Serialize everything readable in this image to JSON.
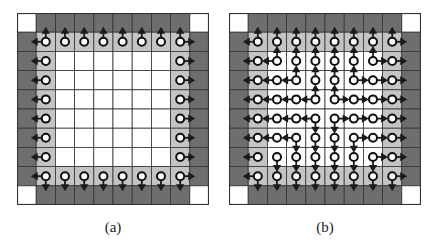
{
  "colors": {
    "outer": "#6e6e6e",
    "boundary": "#c4c4c4",
    "inner": "#ffffff",
    "corner": "#ffffff",
    "grid_line": "#333333",
    "arrow": "#1a1a1a",
    "node_fill": "#ffffff",
    "node_stroke": "#111111"
  },
  "grid_size": 10,
  "panels": [
    {
      "id": "a",
      "caption": "(a)",
      "light_cells": "boundary-ring",
      "nodes": "boundary-ring",
      "arrows": [
        {
          "r": 1,
          "c": 1,
          "d": "L"
        },
        {
          "r": 1,
          "c": 1,
          "d": "U"
        },
        {
          "r": 1,
          "c": 2,
          "d": "U"
        },
        {
          "r": 1,
          "c": 3,
          "d": "U"
        },
        {
          "r": 1,
          "c": 4,
          "d": "U"
        },
        {
          "r": 1,
          "c": 5,
          "d": "U"
        },
        {
          "r": 1,
          "c": 6,
          "d": "U"
        },
        {
          "r": 1,
          "c": 7,
          "d": "U"
        },
        {
          "r": 1,
          "c": 8,
          "d": "U"
        },
        {
          "r": 1,
          "c": 8,
          "d": "R"
        },
        {
          "r": 2,
          "c": 1,
          "d": "L"
        },
        {
          "r": 3,
          "c": 1,
          "d": "L"
        },
        {
          "r": 4,
          "c": 1,
          "d": "L"
        },
        {
          "r": 5,
          "c": 1,
          "d": "L"
        },
        {
          "r": 6,
          "c": 1,
          "d": "L"
        },
        {
          "r": 7,
          "c": 1,
          "d": "L"
        },
        {
          "r": 2,
          "c": 8,
          "d": "R"
        },
        {
          "r": 3,
          "c": 8,
          "d": "R"
        },
        {
          "r": 4,
          "c": 8,
          "d": "R"
        },
        {
          "r": 5,
          "c": 8,
          "d": "R"
        },
        {
          "r": 6,
          "c": 8,
          "d": "R"
        },
        {
          "r": 7,
          "c": 8,
          "d": "R"
        },
        {
          "r": 8,
          "c": 1,
          "d": "L"
        },
        {
          "r": 8,
          "c": 1,
          "d": "D"
        },
        {
          "r": 8,
          "c": 2,
          "d": "D"
        },
        {
          "r": 8,
          "c": 3,
          "d": "D"
        },
        {
          "r": 8,
          "c": 4,
          "d": "D"
        },
        {
          "r": 8,
          "c": 5,
          "d": "D"
        },
        {
          "r": 8,
          "c": 6,
          "d": "D"
        },
        {
          "r": 8,
          "c": 7,
          "d": "D"
        },
        {
          "r": 8,
          "c": 8,
          "d": "D"
        },
        {
          "r": 8,
          "c": 8,
          "d": "R"
        }
      ]
    },
    {
      "id": "b",
      "caption": "(b)",
      "light_cells": "boundary-ring",
      "nodes": "all-inner",
      "arrows": [
        {
          "r": 1,
          "c": 1,
          "d": "L"
        },
        {
          "r": 1,
          "c": 1,
          "d": "U"
        },
        {
          "r": 1,
          "c": 2,
          "d": "U"
        },
        {
          "r": 1,
          "c": 3,
          "d": "U"
        },
        {
          "r": 1,
          "c": 4,
          "d": "U"
        },
        {
          "r": 1,
          "c": 5,
          "d": "U"
        },
        {
          "r": 1,
          "c": 6,
          "d": "U"
        },
        {
          "r": 1,
          "c": 7,
          "d": "U"
        },
        {
          "r": 1,
          "c": 8,
          "d": "U"
        },
        {
          "r": 1,
          "c": 8,
          "d": "R"
        },
        {
          "r": 2,
          "c": 1,
          "d": "L"
        },
        {
          "r": 2,
          "c": 2,
          "d": "L"
        },
        {
          "r": 2,
          "c": 2,
          "d": "U"
        },
        {
          "r": 2,
          "c": 3,
          "d": "U"
        },
        {
          "r": 2,
          "c": 4,
          "d": "U"
        },
        {
          "r": 2,
          "c": 5,
          "d": "U"
        },
        {
          "r": 2,
          "c": 6,
          "d": "U"
        },
        {
          "r": 2,
          "c": 7,
          "d": "U"
        },
        {
          "r": 2,
          "c": 7,
          "d": "R"
        },
        {
          "r": 2,
          "c": 8,
          "d": "R"
        },
        {
          "r": 3,
          "c": 1,
          "d": "L"
        },
        {
          "r": 3,
          "c": 2,
          "d": "L"
        },
        {
          "r": 3,
          "c": 3,
          "d": "L"
        },
        {
          "r": 3,
          "c": 3,
          "d": "U"
        },
        {
          "r": 3,
          "c": 4,
          "d": "U"
        },
        {
          "r": 3,
          "c": 5,
          "d": "U"
        },
        {
          "r": 3,
          "c": 6,
          "d": "U"
        },
        {
          "r": 3,
          "c": 6,
          "d": "R"
        },
        {
          "r": 3,
          "c": 7,
          "d": "R"
        },
        {
          "r": 3,
          "c": 8,
          "d": "R"
        },
        {
          "r": 4,
          "c": 1,
          "d": "L"
        },
        {
          "r": 4,
          "c": 2,
          "d": "L"
        },
        {
          "r": 4,
          "c": 3,
          "d": "L"
        },
        {
          "r": 4,
          "c": 4,
          "d": "L"
        },
        {
          "r": 4,
          "c": 4,
          "d": "U"
        },
        {
          "r": 4,
          "c": 5,
          "d": "U"
        },
        {
          "r": 4,
          "c": 5,
          "d": "R"
        },
        {
          "r": 4,
          "c": 6,
          "d": "R"
        },
        {
          "r": 4,
          "c": 7,
          "d": "R"
        },
        {
          "r": 4,
          "c": 8,
          "d": "R"
        },
        {
          "r": 5,
          "c": 1,
          "d": "L"
        },
        {
          "r": 5,
          "c": 2,
          "d": "L"
        },
        {
          "r": 5,
          "c": 3,
          "d": "L"
        },
        {
          "r": 5,
          "c": 4,
          "d": "L"
        },
        {
          "r": 5,
          "c": 4,
          "d": "D"
        },
        {
          "r": 5,
          "c": 5,
          "d": "D"
        },
        {
          "r": 5,
          "c": 5,
          "d": "R"
        },
        {
          "r": 5,
          "c": 6,
          "d": "R"
        },
        {
          "r": 5,
          "c": 7,
          "d": "R"
        },
        {
          "r": 5,
          "c": 8,
          "d": "R"
        },
        {
          "r": 6,
          "c": 1,
          "d": "L"
        },
        {
          "r": 6,
          "c": 2,
          "d": "L"
        },
        {
          "r": 6,
          "c": 3,
          "d": "L"
        },
        {
          "r": 6,
          "c": 3,
          "d": "D"
        },
        {
          "r": 6,
          "c": 4,
          "d": "D"
        },
        {
          "r": 6,
          "c": 5,
          "d": "D"
        },
        {
          "r": 6,
          "c": 6,
          "d": "D"
        },
        {
          "r": 6,
          "c": 6,
          "d": "R"
        },
        {
          "r": 6,
          "c": 7,
          "d": "R"
        },
        {
          "r": 6,
          "c": 8,
          "d": "R"
        },
        {
          "r": 7,
          "c": 1,
          "d": "L"
        },
        {
          "r": 7,
          "c": 2,
          "d": "D"
        },
        {
          "r": 7,
          "c": 3,
          "d": "D"
        },
        {
          "r": 7,
          "c": 4,
          "d": "D"
        },
        {
          "r": 7,
          "c": 5,
          "d": "D"
        },
        {
          "r": 7,
          "c": 6,
          "d": "D"
        },
        {
          "r": 7,
          "c": 7,
          "d": "D"
        },
        {
          "r": 7,
          "c": 7,
          "d": "R"
        },
        {
          "r": 7,
          "c": 8,
          "d": "R"
        },
        {
          "r": 8,
          "c": 1,
          "d": "L"
        },
        {
          "r": 8,
          "c": 1,
          "d": "D"
        },
        {
          "r": 8,
          "c": 2,
          "d": "D"
        },
        {
          "r": 8,
          "c": 3,
          "d": "D"
        },
        {
          "r": 8,
          "c": 4,
          "d": "D"
        },
        {
          "r": 8,
          "c": 5,
          "d": "D"
        },
        {
          "r": 8,
          "c": 6,
          "d": "D"
        },
        {
          "r": 8,
          "c": 7,
          "d": "D"
        },
        {
          "r": 8,
          "c": 8,
          "d": "D"
        },
        {
          "r": 8,
          "c": 8,
          "d": "R"
        }
      ]
    }
  ]
}
